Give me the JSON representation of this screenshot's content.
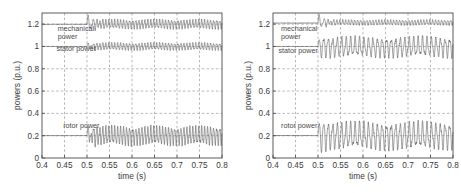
{
  "figure": {
    "panel_count": 2,
    "background_color": "#ffffff",
    "axis_color": "#4a4a4a",
    "grid_color": "#999999",
    "trace_color": "#555555"
  },
  "chart_data": [
    {
      "type": "line",
      "panel": "left",
      "title": "",
      "xlabel": "time (s)",
      "ylabel": "powers (p.u.)",
      "xlim": [
        0.4,
        0.8
      ],
      "ylim": [
        0,
        1.3
      ],
      "xticks": [
        0.4,
        0.45,
        0.5,
        0.55,
        0.6,
        0.65,
        0.7,
        0.75,
        0.8
      ],
      "xticklabels": [
        "0.4",
        "0.45",
        "0.5",
        "0.55",
        "0.6",
        "0.65",
        "0.7",
        "0.75",
        "0.8"
      ],
      "yticks": [
        0,
        0.2,
        0.4,
        0.6,
        0.8,
        1,
        1.2
      ],
      "yticklabels": [
        "0",
        "0.2",
        "0.4",
        "0.6",
        "0.8",
        "1",
        "1.2"
      ],
      "grid": true,
      "grid_style": "dashed",
      "legend_position": "inline-annotations",
      "disturbance_time": 0.5,
      "annotations": [
        {
          "text": "mechanical power",
          "x": 0.435,
          "y": 1.14,
          "lines": [
            "mechanical",
            "power"
          ]
        },
        {
          "text": "stator power",
          "x": 0.432,
          "y": 0.955,
          "lines": [
            "stator power"
          ]
        },
        {
          "text": "rotor power",
          "x": 0.447,
          "y": 0.265,
          "lines": [
            "rotor power"
          ]
        }
      ],
      "series": [
        {
          "name": "mechanical power",
          "steady_value": 1.2,
          "pre_disturbance_value": 1.2,
          "post_mean": 1.2,
          "ripple_amplitude": 0.035,
          "transient_peak": 1.29,
          "transient_min": 1.12,
          "ripple_frequency_hz": 150
        },
        {
          "name": "stator power",
          "steady_value": 1.0,
          "pre_disturbance_value": 1.0,
          "post_mean": 1.0,
          "ripple_amplitude": 0.028,
          "transient_peak": 1.03,
          "transient_min": 0.95,
          "ripple_frequency_hz": 150
        },
        {
          "name": "rotor power",
          "steady_value": 0.2,
          "pre_disturbance_value": 0.2,
          "post_mean": 0.2,
          "ripple_amplitude": 0.07,
          "transient_peak": 0.28,
          "transient_min": 0.12,
          "ripple_frequency_hz": 150
        }
      ]
    },
    {
      "type": "line",
      "panel": "right",
      "title": "",
      "xlabel": "time (s)",
      "ylabel": "powers (p.u.)",
      "xlim": [
        0.4,
        0.8
      ],
      "ylim": [
        0,
        1.3
      ],
      "xticks": [
        0.4,
        0.45,
        0.5,
        0.55,
        0.6,
        0.65,
        0.7,
        0.75,
        0.8
      ],
      "xticklabels": [
        "0.4",
        "0.45",
        "0.5",
        "0.55",
        "0.6",
        "0.65",
        "0.7",
        "0.75",
        "0.8"
      ],
      "yticks": [
        0,
        0.2,
        0.4,
        0.6,
        0.8,
        1,
        1.2
      ],
      "yticklabels": [
        "0",
        "0.2",
        "0.4",
        "0.6",
        "0.8",
        "1",
        "1.2"
      ],
      "grid": true,
      "grid_style": "dashed",
      "legend_position": "inline-annotations",
      "disturbance_time": 0.5,
      "annotations": [
        {
          "text": "mechanical power",
          "x": 0.418,
          "y": 1.135,
          "lines": [
            "mechanical",
            "power"
          ]
        },
        {
          "text": "stator power",
          "x": 0.412,
          "y": 0.945,
          "lines": [
            "stator power"
          ]
        },
        {
          "text": "rotor power",
          "x": 0.418,
          "y": 0.268,
          "lines": [
            "rotor power"
          ]
        }
      ],
      "series": [
        {
          "name": "mechanical power",
          "steady_value": 1.2,
          "pre_disturbance_value": 1.21,
          "post_mean": 1.215,
          "ripple_amplitude": 0.02,
          "transient_peak": 1.3,
          "transient_min": 1.05,
          "ripple_frequency_hz": 150
        },
        {
          "name": "stator power",
          "steady_value": 1.0,
          "pre_disturbance_value": 1.0,
          "post_mean": 0.995,
          "ripple_amplitude": 0.075,
          "transient_peak": 1.05,
          "transient_min": 0.9,
          "ripple_frequency_hz": 100
        },
        {
          "name": "rotor power",
          "steady_value": 0.2,
          "pre_disturbance_value": 0.2,
          "post_mean": 0.2,
          "ripple_amplitude": 0.1,
          "transient_peak": 0.3,
          "transient_min": 0.1,
          "ripple_frequency_hz": 100
        }
      ]
    }
  ]
}
